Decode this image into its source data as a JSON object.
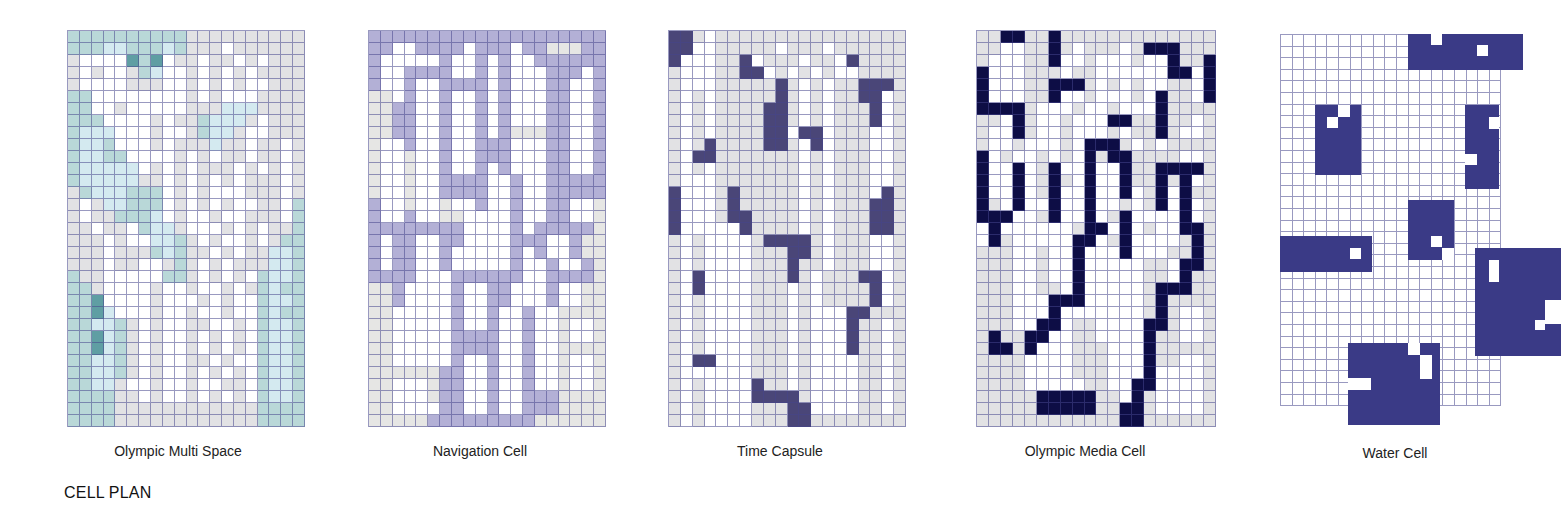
{
  "section_title": "CELL PLAN",
  "colors": {
    "white": "#ffffff",
    "light_gray": "#e2e2e4",
    "teal_light": "#d4eaf0",
    "teal_mid": "#b9d8d8",
    "teal_dark": "#5f9ea3",
    "lavender": "#b3b0d6",
    "pale_gray": "#e6e6e4",
    "navy_dim": "#4a4678",
    "navy": "#0d0d45",
    "water_blue": "#3a3a86",
    "grid_line": "#46468c"
  },
  "panels": [
    {
      "id": "olympic-multi-space",
      "caption": "Olympic Multi Space",
      "legend": {
        "W": "white",
        "G": "light_gray",
        "L": "teal_light",
        "M": "teal_mid",
        "D": "teal_dark"
      },
      "rows": [
        "MMMMMMMMMMGGGGGGGGGG",
        "MMMLLMMMLMGGGWGGGGGG",
        "GWWWWDMDWGGWGGWGWGGG",
        "GWGWWGMLWWGWGWGWGGGG",
        "GWWWWGGGWWGWGWGWWGGG",
        "MMWWWWWWWWGWGWWWGGGG",
        "MMWWGWWWWWGGGLLLGGGG",
        "MMMWWWWGWGGMLLLGWGGG",
        "MLLLWWWGWWGMLLGWWGGG",
        "MLLMWWWGWGGGLGGWGGWG",
        "MLLMMWWWWGWGWGGWGGWG",
        "MLLLLLWGWGWGGGWGWGWG",
        "MLLLLLGGWGWGWGWGGGWG",
        "GMLLLMMMWGWGWWWGGGWG",
        "GWGLLMMMWGWGWGWWGGWM",
        "GWGGMMMLWGWWGWWGGGWM",
        "GGWGGWMLLGWWWGWGWGGM",
        "GGGWGWWLLMGWGWWGWGMM",
        "GGGWGGGMLMGGWGWGGLLM",
        "GGGWGGWWGMGWGWGGGLLM",
        "MGGWWWWWMMGWGWGWMLLM",
        "MMGWWWWGWWGWWGWGMLMM",
        "MMDWWWWGWWWGWGWWMLLM",
        "MMDLWWWGWWGWWGWWMLMM",
        "MMLLMGWGWWGGWWGWMLLM",
        "MMDLMGWGWWGWGWGWMLLM",
        "MMDLMGWGWWGWGWGWMLLM",
        "MMLLMGWGWWGGWGWWMLLM",
        "MMLLMGWGWWGWGWGWMLLM",
        "MMLLGWWGWWGWWGGWMLLM",
        "MMMMGGWGWWGWGWGWMLLM",
        "MMMMGGGGGGGGGGGGMMMM",
        "MMMMGGGGGGGGGGGGMMMM"
      ]
    },
    {
      "id": "navigation-cell",
      "caption": "Navigation Cell",
      "legend": {
        "W": "white",
        "V": "lavender",
        "P": "pale_gray"
      },
      "rows": [
        "VVVVVVVVVVVVVVVVVVVV",
        "VVWWVVVVWVVVWVVPPPVV",
        "VWWWWWVWWVWVWWVVVVVV",
        "VWWVVVVWWVWVWWWVVVWV",
        "VWWVWWVVVVWVWWWVVWWV",
        "PPWVWWVWWVWVWWWVVWWV",
        "PPVVWWVWWVWVWWWVVWWV",
        "PPVVWWVWWVWVWWWVVWWV",
        "PPVVWWVWWVWVPPPVVWWV",
        "PWWVWWVWWVVVWWWVVWWV",
        "PWWPWWVWWVVVWWWVVWWV",
        "PWWPWWVWWVWVWWWVVWWV",
        "PWWPWWVVVVWWVWWVVVVV",
        "PWWPWWVVVVWWVWWVVVVV",
        "VWWPWWPWWVWWVWWVVWWP",
        "VWWVWWPPWWWWVWWVVWWP",
        "VVVVVVVVWWWWVWVVVVVP",
        "VWVVWWVVWWWWVVVWWVPP",
        "VWVVWWVWWWWWVWVWWVPP",
        "VWVVWWVWWWWWVWWVWWVP",
        "VVVVWWWVVVVVVWWVVVVP",
        "PPVWWWWVWWVVWWWVWWPP",
        "PPVWWWWVWWVVWWWVWWPP",
        "PPWWWWWVWWVWWVWWPPPP",
        "PPWWWWWVWWVWWVWWPWWP",
        "PPWWWWWVVVVWWVWWPWWP",
        "PPWWWWWVVVVWWVWWPPPP",
        "PPWWWWWVWWVWWVWWPWWP",
        "PPPPPPVVWWVWWVWWPWWP",
        "PPWWWPVVWWVWWVWWPWWP",
        "PPWWWPVVWWVWWVVVPPPP",
        "PPWWWWVVWWVWWVVVPPPP",
        "PPPPPVVVVVVVVVPPPPPP"
      ]
    },
    {
      "id": "time-capsule",
      "caption": "Time Capsule",
      "legend": {
        "W": "white",
        "G": "light_gray",
        "N": "navy_dim"
      },
      "rows": [
        "NNGWGGGGGGGGGGGGGGGG",
        "NNWWGGGGGWGGGWGGGGGG",
        "NWWWGGNWGGGWGGWNGGGG",
        "GWWWGGNNWGWGWGWWGGGG",
        "GWWWGGGGGNGWGWGGNNNG",
        "GWGWGGGGGNGWGWGGNNWG",
        "GWGWGGGGNNGWGWGGGNWG",
        "GWGWGGGGNNGWGWGGGNWG",
        "GWGWGGGGNNWNNWGGGWWG",
        "GWGNGGGGNNGWNWGGGWWG",
        "GWNNGGGGGGGWGWGGGWWG",
        "GWGWGGGGGGGWGWGGGWWG",
        "GWWWGGGGGGGWGWGGGWWG",
        "NWWWGNGGGGGWGWGGGWNG",
        "NWWWGNGGGGGWGWGGGNNG",
        "NWWWGNNGGGGWGWGGGNNG",
        "NWWWWWNGGGGWGWGGGNNG",
        "GWGWWWWGNNNNGWGGGWWG",
        "GWGWWWWGGGNNGWGGGWWG",
        "GWGWWWWGGGNGGWGGGWWG",
        "GWNWWWWGGGNGWGGGNNWG",
        "GWNWWWWGGGWGWGGGGNWG",
        "GWGWWWWGGGWGWGGGGNWG",
        "GWGWWWWGGGWGWWWNNGGG",
        "GWGWWWWGGGWGWWWNGGWG",
        "GWGWWWWGGGWGWWWNGGWG",
        "GWGWWWWGGGWGWWWNGGWG",
        "GWNNWWWGGGWGWWWWGGWG",
        "GWWWWWWGGGWGWWWWGGWG",
        "GWGWWWWNGGWGWWWWGGWG",
        "GWGWWWWNNNNGWWWWGGWG",
        "GWGWWWWGGGNNWWWWGGWG",
        "GWGWWWWGGGNNGGGGGGGG"
      ]
    },
    {
      "id": "olympic-media-cell",
      "caption": "Olympic Media Cell",
      "legend": {
        "W": "white",
        "G": "light_gray",
        "K": "navy"
      },
      "rows": [
        "GGKKGGKGGGGGGGGGGGGG",
        "GGWWGGKGWGGGWGKKKGGG",
        "GWWWGGKWWGWWWGWWKGGK",
        "KWWWGGGWGGWWWWWWKKWK",
        "KWWWGGKKKGWGWGWWGGWK",
        "KWWWGGKWWGWWWGWKGGWK",
        "KKKKGWWWGWWGWWWKGGGG",
        "GGWKGWWGWWWKKGGKGGWG",
        "GWWKGWWGWWWGWGGKGWWG",
        "GWWGWWWGWKKKGWGWGGGG",
        "KWGWWGWGWKGKKGGGGWWG",
        "KWWKWGKWWKWWKGGKKKKG",
        "KWWKWGKGWKWWKGGKGKWG",
        "KWWKWGKWWKWWKWGKWKGG",
        "KGWKWWKWWKWWGWGKWKWG",
        "KKKWWGKWWKWGKWWWWKWG",
        "WKWWWWWWGKKWKWGWWKKG",
        "WKGWWWWWKKWGKWWWWGKG",
        "GGGWWGWWKWWWKWWWGGKG",
        "GGGWWGWWKWWWWWGGWKKG",
        "GGGWWGWWKWWWWWGGWKGG",
        "GGGWWGGWKWWWWWGKKKGG",
        "GGGWWWKKKWWWWWGKGGGG",
        "GGGWWWKWWWWWWWGKGWWG",
        "GGGWWKKWGGWWWWKKGWWG",
        "GKGGKKWWGGWWWWKGGWWG",
        "GKKGKWWWGGGWWWKGGGGG",
        "GGGGWWWWGGGWWWKGGWWG",
        "GGGGWWWWGGGWWWKWWWWG",
        "GGGGWWWWWGGWWKKWWWWG",
        "GGGGGKKKKKGGWKGWWWWG",
        "GGGGGKKKKKGGKKGWWWWG",
        "GGGGGGGGGGGGKKGGGGGG"
      ]
    }
  ],
  "water_cell": {
    "caption": "Water Cell",
    "grid": {
      "x": 1280,
      "y": 34,
      "cols": 19,
      "rows": 32,
      "cell": 11.6
    },
    "blocks": [
      {
        "x": 1408,
        "y": 34,
        "w": 115,
        "h": 36
      },
      {
        "x": 1315,
        "y": 105,
        "w": 46,
        "h": 70
      },
      {
        "x": 1465,
        "y": 105,
        "w": 34,
        "h": 84
      },
      {
        "x": 1280,
        "y": 236,
        "w": 92,
        "h": 36
      },
      {
        "x": 1408,
        "y": 200,
        "w": 46,
        "h": 60
      },
      {
        "x": 1475,
        "y": 248,
        "w": 86,
        "h": 108
      },
      {
        "x": 1348,
        "y": 343,
        "w": 92,
        "h": 82
      }
    ],
    "holes": [
      {
        "x": 1431,
        "y": 34,
        "w": 11,
        "h": 11
      },
      {
        "x": 1477,
        "y": 45,
        "w": 11,
        "h": 11
      },
      {
        "x": 1338,
        "y": 105,
        "w": 12,
        "h": 12
      },
      {
        "x": 1327,
        "y": 117,
        "w": 11,
        "h": 11
      },
      {
        "x": 1489,
        "y": 117,
        "w": 10,
        "h": 12
      },
      {
        "x": 1465,
        "y": 154,
        "w": 12,
        "h": 11
      },
      {
        "x": 1350,
        "y": 248,
        "w": 11,
        "h": 11
      },
      {
        "x": 1431,
        "y": 236,
        "w": 11,
        "h": 11
      },
      {
        "x": 1442,
        "y": 248,
        "w": 12,
        "h": 12
      },
      {
        "x": 1489,
        "y": 260,
        "w": 10,
        "h": 22
      },
      {
        "x": 1545,
        "y": 300,
        "w": 16,
        "h": 24
      },
      {
        "x": 1535,
        "y": 320,
        "w": 10,
        "h": 10
      },
      {
        "x": 1408,
        "y": 343,
        "w": 12,
        "h": 12
      },
      {
        "x": 1420,
        "y": 355,
        "w": 12,
        "h": 24
      },
      {
        "x": 1348,
        "y": 378,
        "w": 23,
        "h": 12
      }
    ]
  }
}
